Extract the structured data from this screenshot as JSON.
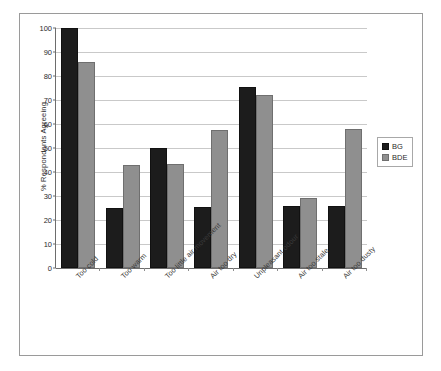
{
  "chart_data": {
    "type": "bar",
    "title": "",
    "subtitle": "",
    "xlabel": "",
    "ylabel": "% Respondents Agreeing",
    "ylim": [
      0,
      100
    ],
    "ytick_labels": [
      "0",
      "10",
      "20",
      "30",
      "40",
      "50",
      "60",
      "70",
      "80",
      "90",
      "100"
    ],
    "ytick_values": [
      0,
      10,
      20,
      30,
      40,
      50,
      60,
      70,
      80,
      90,
      100
    ],
    "grid": true,
    "legend_position": "right",
    "categories": [
      "Too cold",
      "Too warm",
      "Too little air movement",
      "Air too dry",
      "Unpleasant odour",
      "Air too stale",
      "Air too dusty"
    ],
    "series": [
      {
        "name": "BG",
        "color": "#1c1c1c",
        "values": [
          100,
          25,
          50,
          25.5,
          75.5,
          26,
          26
        ]
      },
      {
        "name": "BDE",
        "color": "#8f8f8f",
        "values": [
          86,
          43,
          43.5,
          57.5,
          72,
          29,
          58
        ]
      }
    ]
  },
  "legend": {
    "items": [
      {
        "label": "BG"
      },
      {
        "label": "BDE"
      }
    ]
  }
}
